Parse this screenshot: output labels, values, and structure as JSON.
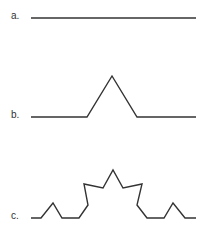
{
  "figure": {
    "stroke_color": "#333333",
    "items": [
      {
        "label": "a.",
        "points": "31,18 196,18"
      },
      {
        "label": "b.",
        "points": "31,117 87,117 112,76 137,117 196,117"
      },
      {
        "label": "c.",
        "points": "31,218 41,218 53,203 62,218 79,218 88,205 84,184 103,188 113,170 123,188 142,184 137,205 147,218 164,218 173,203 185,218 196,218"
      }
    ]
  }
}
